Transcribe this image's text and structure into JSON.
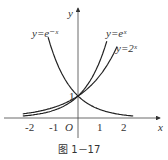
{
  "figure": {
    "caption": "图 1－17",
    "axes": {
      "x_label": "x",
      "y_label": "y",
      "origin_label": "O",
      "x_ticks": [
        "-2",
        "-1",
        "1",
        "2"
      ],
      "y_ticks": [
        "1"
      ]
    },
    "curves": [
      {
        "label": "y=e⁻ˣ",
        "func": "exp(-x)"
      },
      {
        "label": "y=eˣ",
        "func": "exp(x)"
      },
      {
        "label": "y=2ˣ",
        "func": "2^x"
      }
    ],
    "colors": {
      "stroke": "#222222",
      "text": "#333333"
    }
  }
}
